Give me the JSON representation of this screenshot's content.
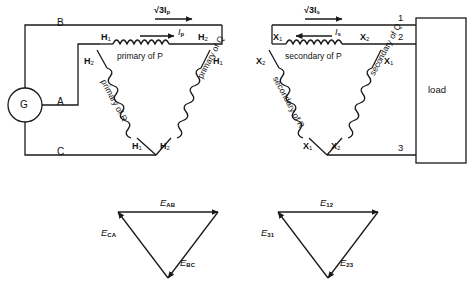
{
  "diagram": {
    "stroke_color": "#1a1a1a",
    "background": "#ffffff"
  },
  "source": {
    "generator_label": "G",
    "line_b": "B",
    "line_a": "A",
    "line_c": "C"
  },
  "primary": {
    "current_line": "√3I",
    "current_line_sub": "p",
    "current_phase": "I",
    "current_phase_sub": "p",
    "winding_top": "primary of P",
    "winding_left": "primary of R",
    "winding_right": "primary of Q",
    "terminals": {
      "top_left_h1": "H",
      "top_left_h1_sub": "1",
      "top_right_h2": "H",
      "top_right_h2_sub": "2",
      "left_h2": "H",
      "left_h2_sub": "2",
      "right_h1": "H",
      "right_h1_sub": "1",
      "bottom_left_h1": "H",
      "bottom_left_h1_sub": "1",
      "bottom_right_h2": "H",
      "bottom_right_h2_sub": "2"
    }
  },
  "secondary": {
    "current_line": "√3I",
    "current_line_sub": "s",
    "current_phase": "I",
    "current_phase_sub": "s",
    "winding_top": "secondary of P",
    "winding_left": "secondary of R",
    "winding_right": "secondary of Q",
    "terminals": {
      "top_left_x1": "X",
      "top_left_x1_sub": "1",
      "top_right_x2": "X",
      "top_right_x2_sub": "2",
      "left_x2": "X",
      "left_x2_sub": "2",
      "right_x1": "X",
      "right_x1_sub": "1",
      "bottom_left_x1": "X",
      "bottom_left_x1_sub": "1",
      "bottom_right_x2": "X",
      "bottom_right_x2_sub": "2"
    }
  },
  "load": {
    "label": "load",
    "terminal_1": "1",
    "terminal_2": "2",
    "terminal_3": "3"
  },
  "phasor_primary": {
    "top": "E",
    "top_sub": "AB",
    "left": "E",
    "left_sub": "CA",
    "right": "E",
    "right_sub": "BC"
  },
  "phasor_secondary": {
    "top": "E",
    "top_sub": "12",
    "left": "E",
    "left_sub": "31",
    "right": "E",
    "right_sub": "23"
  }
}
